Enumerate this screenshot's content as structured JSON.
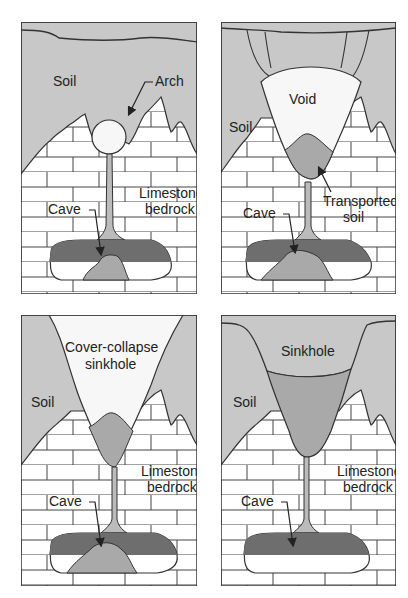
{
  "colors": {
    "soil": "#c8c8c8",
    "void": "#f7f7f7",
    "transported_soil": "#a9a9a9",
    "cave_water": "#6e6e6e",
    "cave_sediment": "#a9a9a9",
    "bedrock": "#ffffff",
    "lines": "#333333"
  },
  "panels": [
    {
      "id": "panel-1",
      "labels": {
        "soil": "Soil",
        "arch": "Arch",
        "bedrock_1": "Limestone",
        "bedrock_2": "bedrock",
        "cave": "Cave"
      }
    },
    {
      "id": "panel-2",
      "labels": {
        "soil": "Soil",
        "void": "Void",
        "transported_1": "Transported",
        "transported_2": "soil",
        "cave": "Cave"
      }
    },
    {
      "id": "panel-3",
      "labels": {
        "soil": "Soil",
        "sinkhole_1": "Cover-collapse",
        "sinkhole_2": "sinkhole",
        "bedrock_1": "Limestone",
        "bedrock_2": "bedrock",
        "cave": "Cave"
      }
    },
    {
      "id": "panel-4",
      "labels": {
        "soil": "Soil",
        "sinkhole": "Sinkhole",
        "bedrock_1": "Limestone",
        "bedrock_2": "bedrock",
        "cave": "Cave"
      }
    }
  ]
}
